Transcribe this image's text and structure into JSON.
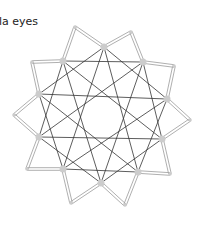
{
  "title": "la eyes",
  "colors": {
    "background": "#ffffff",
    "text": "#222222",
    "ribbon": "#9a9a9a",
    "edge": "#333333",
    "node": "#cccccc"
  },
  "inner_nodes": [
    [
      104,
      47
    ],
    [
      143,
      62
    ],
    [
      167,
      99
    ],
    [
      162,
      139
    ],
    [
      138,
      172
    ],
    [
      101,
      183
    ],
    [
      63,
      169
    ],
    [
      39,
      137
    ],
    [
      39,
      94
    ],
    [
      63,
      61
    ]
  ],
  "outer_points": [
    [
      131,
      32
    ],
    [
      174,
      66
    ],
    [
      190,
      120
    ],
    [
      170,
      174
    ],
    [
      125,
      205
    ],
    [
      71,
      203
    ],
    [
      27,
      169
    ],
    [
      14,
      115
    ],
    [
      32,
      62
    ],
    [
      75,
      27
    ]
  ],
  "edge_steps": [
    2,
    4
  ]
}
